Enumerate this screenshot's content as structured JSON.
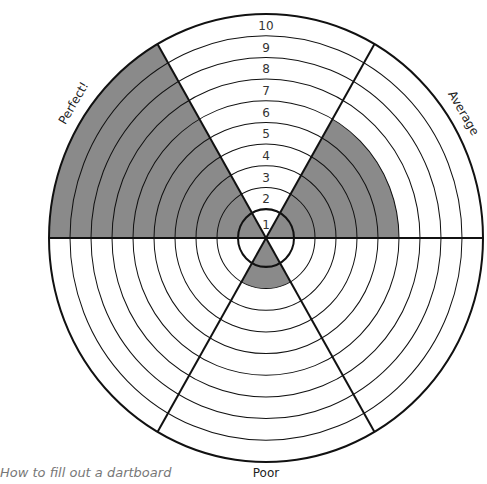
{
  "caption": "How to fill out a dartboard",
  "colors": {
    "fill": "#8a8a8a",
    "line": "#111111",
    "background": "#ffffff"
  },
  "chart_data": {
    "type": "radial-dartboard",
    "title": "How to fill out a dartboard",
    "rings": [
      "1",
      "2",
      "3",
      "4",
      "5",
      "6",
      "7",
      "8",
      "9",
      "10"
    ],
    "sectors": [
      {
        "name": "top",
        "label": "",
        "start_deg": -30,
        "end_deg": 30,
        "filled_to": 0
      },
      {
        "name": "upper-right",
        "label": "Average",
        "start_deg": 30,
        "end_deg": 90,
        "filled_to": 6
      },
      {
        "name": "lower-right",
        "label": "",
        "start_deg": 90,
        "end_deg": 150,
        "filled_to": 0
      },
      {
        "name": "bottom",
        "label": "Poor",
        "start_deg": 150,
        "end_deg": 210,
        "filled_to": 2
      },
      {
        "name": "lower-left",
        "label": "",
        "start_deg": 210,
        "end_deg": 270,
        "filled_to": 0
      },
      {
        "name": "upper-left",
        "label": "Perfect!",
        "start_deg": 270,
        "end_deg": 330,
        "filled_to": 10
      }
    ]
  },
  "labels": {
    "perfect": "Perfect!",
    "average": "Average",
    "poor": "Poor"
  }
}
